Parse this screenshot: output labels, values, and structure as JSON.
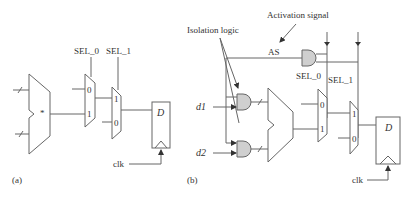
{
  "diagram": {
    "panel_a": {
      "label": "(a)",
      "sel0": "SEL_0",
      "sel1": "SEL_1",
      "mux1_in0": "0",
      "mux1_in1": "1",
      "mux2_in1": "1",
      "mux2_in0": "0",
      "op_symbol": "*",
      "ff_d": "D",
      "clk": "clk"
    },
    "panel_b": {
      "label": "(b)",
      "activation_signal": "Activation signal",
      "isolation_logic": "Isolation logic",
      "as": "AS",
      "sel0": "SEL_0",
      "sel1": "SEL_1",
      "d1": "d1",
      "d2": "d2",
      "mux1_in0": "0",
      "mux1_in1": "1",
      "mux2_in1": "1",
      "mux2_in0": "0",
      "ff_d": "D",
      "clk": "clk"
    }
  }
}
